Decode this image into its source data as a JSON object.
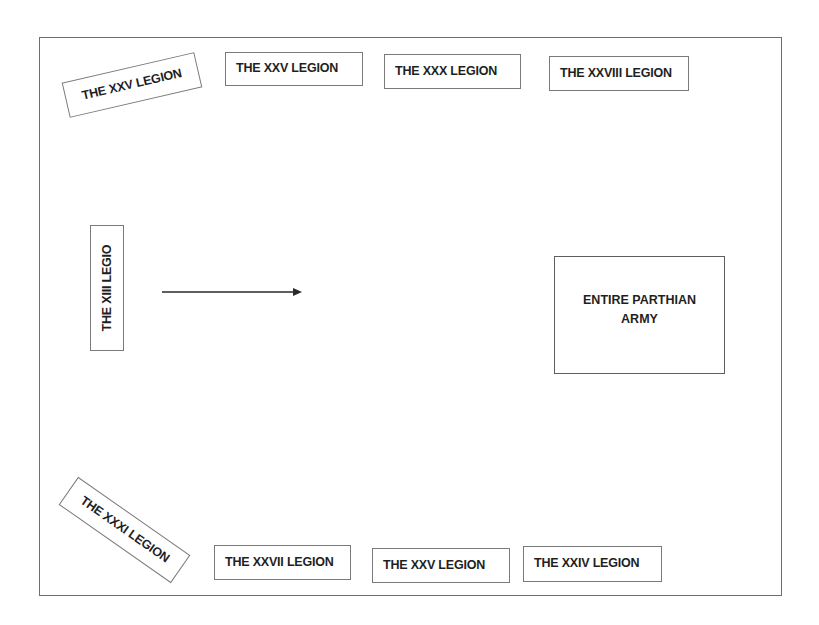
{
  "diagram": {
    "title": "",
    "colors": {
      "border": "#7a7a7a",
      "text": "#1f1f1f",
      "background": "#ffffff"
    },
    "legions_top": [
      {
        "label": "THE XXV LEGION",
        "rotation_deg": -13
      },
      {
        "label": "THE XXV LEGION",
        "rotation_deg": 0
      },
      {
        "label": "THE XXX LEGION",
        "rotation_deg": 0
      },
      {
        "label": "THE XXVIII LEGION",
        "rotation_deg": 0
      }
    ],
    "legion_left": {
      "label": "THE XIII LEGIO",
      "rotation_deg": -90
    },
    "legions_bottom": [
      {
        "label": "THE XXXI LEGION",
        "rotation_deg": 35
      },
      {
        "label": "THE XXVII LEGION",
        "rotation_deg": 0
      },
      {
        "label": "THE XXV LEGION",
        "rotation_deg": 0
      },
      {
        "label": "THE XXIV LEGION",
        "rotation_deg": 0
      }
    ],
    "enemy": {
      "label": "ENTIRE PARTHIAN ARMY"
    },
    "arrow": {
      "icon": "arrow-right-icon",
      "direction": "right"
    }
  }
}
